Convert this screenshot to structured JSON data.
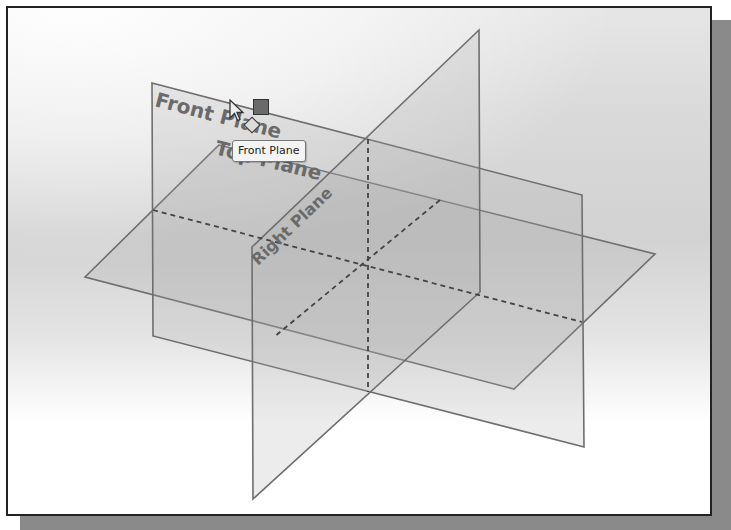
{
  "viewport": {
    "planes": [
      {
        "name": "Front Plane",
        "label": "Front Plane",
        "points": "150,81 580,193 582,445 151,334"
      },
      {
        "name": "Top Plane",
        "label": "Top Plane",
        "points": "217,143 653,252 512,387 83,275"
      },
      {
        "name": "Right Plane",
        "label": "Right Plane",
        "points": "250,245 477,28 478,290 251,497"
      }
    ],
    "labels": {
      "front": "Front Plane",
      "top": "Top Plane",
      "right": "Right Plane"
    },
    "tooltip": "Front Plane",
    "cursor": "arrow-cursor",
    "icons": [
      "cursor-arrow-icon",
      "selection-square-icon",
      "plane-icon"
    ]
  }
}
